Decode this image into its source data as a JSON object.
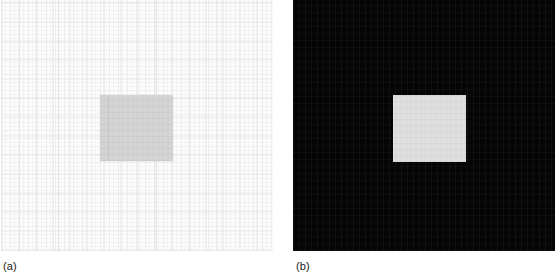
{
  "figure": {
    "width": 555,
    "height": 277,
    "background_color": "#ffffff",
    "panels": [
      {
        "id": "a",
        "caption": "(a)",
        "background_color": "#fcfcfc",
        "description": "bright near-white woven texture background",
        "square": {
          "fill_color": "#d2d2d2",
          "description": "light gray square patch"
        }
      },
      {
        "id": "b",
        "caption": "(b)",
        "background_color": "#050505",
        "description": "black background",
        "square": {
          "fill_color": "#dddddd",
          "description": "light gray / near-white square patch"
        }
      }
    ]
  },
  "captions": {
    "panel_a": "(a)",
    "panel_b": "(b)"
  }
}
